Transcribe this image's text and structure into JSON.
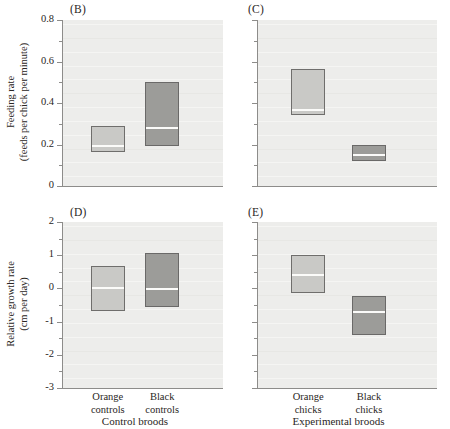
{
  "figure": {
    "background_color": "#ffffff",
    "plot_background_color": "#ededeb",
    "light_box_color": "#c9c9c6",
    "dark_box_color": "#9c9c99",
    "median_color": "#fbfbf9",
    "axis_color": "#8d8c8a"
  },
  "panels": {
    "B": {
      "label": "(B)",
      "ylabel_line1": "Feeding rate",
      "ylabel_line2": "(feeds per chick per minute)",
      "yticks": [
        "0.8",
        "0.6",
        "0.4",
        "0.2",
        "0"
      ],
      "ytick_values": [
        0.8,
        0.6,
        0.4,
        0.2,
        0
      ],
      "minor_ytick_values": [
        0.7,
        0.5,
        0.3,
        0.1
      ],
      "ylim": [
        0,
        0.8
      ]
    },
    "C": {
      "label": "(C)",
      "yticks": [
        "0.8",
        "0.6",
        "0.4",
        "0.2",
        "0"
      ],
      "ytick_values": [
        0.8,
        0.6,
        0.4,
        0.2,
        0
      ],
      "minor_ytick_values": [
        0.7,
        0.5,
        0.3,
        0.1
      ],
      "ylim": [
        0,
        0.8
      ]
    },
    "D": {
      "label": "(D)",
      "ylabel_line1": "Relative growth rate",
      "ylabel_line2": "(cm per day)",
      "yticks": [
        "2",
        "1",
        "0",
        "-1",
        "-2",
        "-3"
      ],
      "ytick_values": [
        2,
        1,
        0,
        -1,
        -2,
        -3
      ],
      "minor_ytick_values": [
        1.5,
        0.5,
        -0.5,
        -1.5,
        -2.5
      ],
      "ylim": [
        -3,
        2
      ]
    },
    "E": {
      "label": "(E)",
      "yticks": [
        "2",
        "1",
        "0",
        "-1",
        "-2",
        "-3"
      ],
      "ytick_values": [
        2,
        1,
        0,
        -1,
        -2,
        -3
      ],
      "minor_ytick_values": [
        1.5,
        0.5,
        -0.5,
        -1.5,
        -2.5
      ],
      "ylim": [
        -3,
        2
      ]
    }
  },
  "xaxis": {
    "left_group_label": "Control broods",
    "right_group_label": "Experimental broods",
    "categories": [
      {
        "line1": "Orange",
        "line2": "controls"
      },
      {
        "line1": "Black",
        "line2": "controls"
      },
      {
        "line1": "Orange",
        "line2": "chicks"
      },
      {
        "line1": "Black",
        "line2": "chicks"
      }
    ]
  },
  "chart_data": [
    {
      "type": "box",
      "panel": "B",
      "title": "(B)",
      "xlabel": "Control broods",
      "ylabel": "Feeding rate (feeds per chick per minute)",
      "ylim": [
        0,
        0.8
      ],
      "yticks": [
        0,
        0.2,
        0.4,
        0.6,
        0.8
      ],
      "grid": false,
      "legend": "none",
      "boxes": [
        {
          "category": "Orange controls",
          "shade": "light",
          "lower": 0.165,
          "median": 0.2,
          "upper": 0.29
        },
        {
          "category": "Black controls",
          "shade": "dark",
          "lower": 0.19,
          "median": 0.285,
          "upper": 0.5
        }
      ]
    },
    {
      "type": "box",
      "panel": "C",
      "title": "(C)",
      "xlabel": "Experimental broods",
      "ylabel": "Feeding rate (feeds per chick per minute)",
      "ylim": [
        0,
        0.8
      ],
      "yticks": [
        0,
        0.2,
        0.4,
        0.6,
        0.8
      ],
      "grid": false,
      "legend": "none",
      "boxes": [
        {
          "category": "Orange chicks",
          "shade": "light",
          "lower": 0.345,
          "median": 0.37,
          "upper": 0.565
        },
        {
          "category": "Black chicks",
          "shade": "dark",
          "lower": 0.125,
          "median": 0.155,
          "upper": 0.2
        }
      ]
    },
    {
      "type": "box",
      "panel": "D",
      "title": "(D)",
      "xlabel": "Control broods",
      "ylabel": "Relative growth rate (cm per day)",
      "ylim": [
        -3,
        2
      ],
      "yticks": [
        -3,
        -2,
        -1,
        0,
        1,
        2
      ],
      "grid": false,
      "legend": "none",
      "boxes": [
        {
          "category": "Orange controls",
          "shade": "light",
          "lower": -0.68,
          "median": 0.05,
          "upper": 0.68
        },
        {
          "category": "Black controls",
          "shade": "dark",
          "lower": -0.55,
          "median": 0.02,
          "upper": 1.07
        }
      ]
    },
    {
      "type": "box",
      "panel": "E",
      "title": "(E)",
      "xlabel": "Experimental broods",
      "ylabel": "Relative growth rate (cm per day)",
      "ylim": [
        -3,
        2
      ],
      "yticks": [
        -3,
        -2,
        -1,
        0,
        1,
        2
      ],
      "grid": false,
      "legend": "none",
      "boxes": [
        {
          "category": "Orange chicks",
          "shade": "light",
          "lower": -0.15,
          "median": 0.42,
          "upper": 1.0
        },
        {
          "category": "Black chicks",
          "shade": "dark",
          "lower": -1.38,
          "median": -0.67,
          "upper": -0.22
        }
      ]
    }
  ]
}
